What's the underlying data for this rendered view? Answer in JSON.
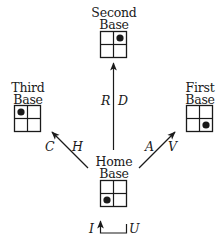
{
  "diagram": {
    "type": "baseball-state-transition",
    "nodes": [
      {
        "id": "second",
        "label_line1": "Second",
        "label_line2": "Base",
        "dot_cell": "top-right"
      },
      {
        "id": "third",
        "label_line1": "Third",
        "label_line2": "Base",
        "dot_cell": "top-left"
      },
      {
        "id": "first",
        "label_line1": "First",
        "label_line2": "Base",
        "dot_cell": "bottom-right"
      },
      {
        "id": "home",
        "label_line1": "Home",
        "label_line2": "Base",
        "dot_cell": "bottom-left"
      }
    ],
    "edges": [
      {
        "from": "home",
        "to": "second",
        "label_left": "R",
        "label_right": "D"
      },
      {
        "from": "home",
        "to": "third",
        "label_left": "C",
        "label_right": "H"
      },
      {
        "from": "home",
        "to": "first",
        "label_left": "A",
        "label_right": "V"
      },
      {
        "from": "home",
        "to": "home",
        "label_left": "I",
        "label_right": "U"
      }
    ],
    "colors": {
      "ink": "#1a1a1a",
      "background": "#ffffff"
    }
  }
}
